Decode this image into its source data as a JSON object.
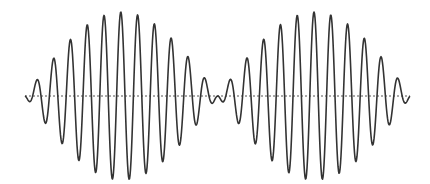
{
  "diagram": {
    "title": "",
    "colors": {
      "background": "#ffffff",
      "wave": "#333333",
      "baseline": "#555555"
    }
  },
  "chart_data": {
    "type": "line",
    "title": "",
    "xlabel": "",
    "ylabel": "",
    "grid": false,
    "legend": null,
    "baseline_y_px": 96,
    "x_start_px": 25,
    "x_end_px": 410,
    "envelope": {
      "shape": "sine",
      "amplitude_px": 84,
      "half_period_px": 193,
      "zero_at_px": [
        25,
        218,
        410
      ]
    },
    "carrier": {
      "period_px": 16.8,
      "peak_reference_px": 120.8
    },
    "peaks_px": [
      {
        "x": 27,
        "y": 95
      },
      {
        "x": 41,
        "y": 74
      },
      {
        "x": 58,
        "y": 54
      },
      {
        "x": 74,
        "y": 39
      },
      {
        "x": 91,
        "y": 26
      },
      {
        "x": 108,
        "y": 16
      },
      {
        "x": 125,
        "y": 12
      },
      {
        "x": 142,
        "y": 17
      },
      {
        "x": 159,
        "y": 29
      },
      {
        "x": 176,
        "y": 44
      },
      {
        "x": 192,
        "y": 61
      },
      {
        "x": 208,
        "y": 82
      },
      {
        "x": 235,
        "y": 76
      },
      {
        "x": 252,
        "y": 57
      },
      {
        "x": 268,
        "y": 39
      },
      {
        "x": 285,
        "y": 23
      },
      {
        "x": 302,
        "y": 15
      },
      {
        "x": 318,
        "y": 16
      },
      {
        "x": 335,
        "y": 20
      },
      {
        "x": 352,
        "y": 27
      },
      {
        "x": 369,
        "y": 40
      },
      {
        "x": 386,
        "y": 59
      },
      {
        "x": 402,
        "y": 80
      }
    ]
  }
}
